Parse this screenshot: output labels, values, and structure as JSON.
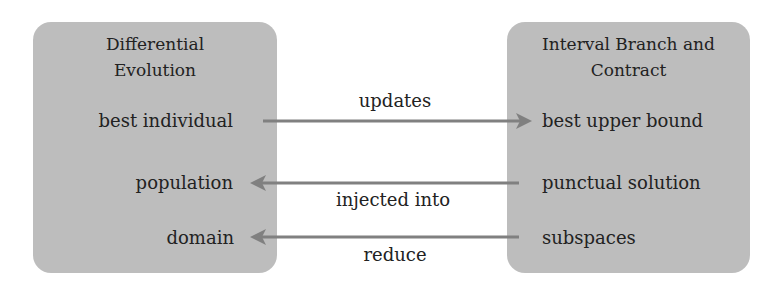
{
  "left_block": {
    "title_line1": "Differential",
    "title_line2": "Evolution",
    "items": [
      "best individual",
      "population",
      "domain"
    ]
  },
  "right_block": {
    "title_line1": "Interval Branch and",
    "title_line2": "Contract",
    "items": [
      "best upper bound",
      "punctual solution",
      "subspaces"
    ]
  },
  "edges": [
    {
      "from": "best individual",
      "to": "best upper bound",
      "label": "updates",
      "direction": "right"
    },
    {
      "from": "punctual solution",
      "to": "population",
      "label": "injected into",
      "direction": "left"
    },
    {
      "from": "subspaces",
      "to": "domain",
      "label": "reduce",
      "direction": "left"
    }
  ],
  "colors": {
    "box": "#bdbdbd",
    "arrow": "#808080",
    "text": "#222222"
  }
}
